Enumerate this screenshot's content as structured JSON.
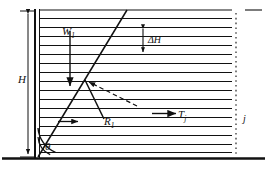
{
  "figure": {
    "background": "#ffffff",
    "ink": "#111111",
    "width": 267,
    "height": 169
  },
  "labels": {
    "height": {
      "text": "H",
      "symbol": "H",
      "meaning": "wall height"
    },
    "weight": {
      "text": "W",
      "symbol": "W",
      "subscript": "1",
      "meaning": "weight of wedge"
    },
    "delta_h": {
      "text": "ΔH",
      "symbol": "ΔH",
      "meaning": "layer thickness increment"
    },
    "reaction": {
      "text": "R",
      "symbol": "R",
      "subscript": "1",
      "meaning": "reaction force on failure plane"
    },
    "tension": {
      "text": "T",
      "symbol": "T",
      "subscript": "j",
      "meaning": "tensile force in reinforcement layer j"
    },
    "layer_index": {
      "text": "j",
      "symbol": "j",
      "meaning": "reinforcement layer index"
    },
    "angle": {
      "text": "θ",
      "symbol": "θ",
      "meaning": "failure plane inclination angle"
    }
  },
  "geometry": {
    "wall": {
      "x": 38,
      "y_top": 10,
      "y_bottom": 157,
      "style": "double-thick-vertical"
    },
    "ground": {
      "y": 158,
      "x_start": 2,
      "x_end": 265,
      "style": "thick-horizontal"
    },
    "failure_plane": {
      "x1": 38,
      "y1": 157,
      "x2": 127,
      "y2": 10,
      "style": "solid-inclined"
    },
    "reinforcement_layers": {
      "count": 16,
      "x_start": 40,
      "x_end": 232,
      "y_first": 18,
      "y_last": 152,
      "spacing": 8.93,
      "style": "solid-horizontal"
    },
    "layer_end_dotted": {
      "x": 236,
      "y_top": 14,
      "y_bottom": 156,
      "style": "dotted-vertical"
    },
    "top_dash": {
      "x1": 245,
      "x2": 262,
      "y": 10,
      "style": "short-dash"
    },
    "dimension_H": {
      "x": 28,
      "y_top": 12,
      "y_bottom": 156,
      "style": "double-arrow-vertical"
    },
    "dimension_dH": {
      "x": 143,
      "y_top": 28,
      "y_bottom": 53,
      "style": "double-arrow-vertical"
    },
    "arrow_W1": {
      "x": 70,
      "y1": 30,
      "y2": 84,
      "direction": "down"
    },
    "arrow_R1": {
      "x1": 85,
      "y1": 80,
      "x2": 106,
      "y2": 120,
      "direction": "down-right"
    },
    "arrow_R1_tick": {
      "x1": 58,
      "y1": 122,
      "x2": 76,
      "y2": 122,
      "direction": "right"
    },
    "arrow_dashed": {
      "x1": 136,
      "y1": 105,
      "x2": 88,
      "y2": 82,
      "direction": "up-left",
      "style": "dashed"
    },
    "arrow_Tj": {
      "x1": 152,
      "y1": 114,
      "x2": 175,
      "y2": 114,
      "direction": "right"
    },
    "angle_arc": {
      "cx": 38,
      "cy": 157,
      "radius_outer": 30,
      "radius_inner": 20
    }
  }
}
